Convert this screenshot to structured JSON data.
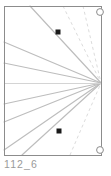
{
  "figure": {
    "caption": "112_6",
    "type": "perspective-line-diagram",
    "canvas": {
      "width": 111,
      "height": 176
    },
    "colors": {
      "frame": "#8c8c8c",
      "ray": "#bdbdbd",
      "ray_faint": "#d4d4d4",
      "dashed": "#dcdcdc",
      "point_marker": "#1a1a1a",
      "circle_marker": "#8c8c8c",
      "background": "#ffffff",
      "caption_text": "#9a9a9a"
    },
    "frame": {
      "x": 4,
      "y": 6,
      "width": 97,
      "height": 149
    },
    "vanishing_point": {
      "x": 101,
      "y": 83
    },
    "horizon_line": {
      "x1": 4,
      "y1": 83,
      "x2": 101,
      "y2": 83
    },
    "rays": [
      {
        "name": "ray-top-steep",
        "x1": 30,
        "y1": 6,
        "x2": 101,
        "y2": 83
      },
      {
        "name": "ray-upper-left-edge",
        "x1": 4,
        "y1": 42,
        "x2": 101,
        "y2": 83
      },
      {
        "name": "ray-upper-shallow",
        "x1": 4,
        "y1": 63,
        "x2": 101,
        "y2": 83
      },
      {
        "name": "ray-lower-shallow",
        "x1": 4,
        "y1": 104,
        "x2": 101,
        "y2": 83
      },
      {
        "name": "ray-lower-left-edge",
        "x1": 4,
        "y1": 122,
        "x2": 101,
        "y2": 83
      },
      {
        "name": "ray-bottom-steep",
        "x1": 22,
        "y1": 155,
        "x2": 101,
        "y2": 83
      },
      {
        "name": "ray-bottom-corner",
        "x1": 4,
        "y1": 150,
        "x2": 101,
        "y2": 83
      }
    ],
    "dashed_rays": [
      {
        "name": "dashed-ray-upper",
        "x1": 63,
        "y1": 6,
        "x2": 101,
        "y2": 83
      },
      {
        "name": "dashed-ray-upper-outer",
        "x1": 83,
        "y1": 6,
        "x2": 101,
        "y2": 83
      },
      {
        "name": "dashed-ray-lower",
        "x1": 70,
        "y1": 155,
        "x2": 101,
        "y2": 83
      }
    ],
    "point_markers": [
      {
        "name": "point-marker-upper",
        "x": 58,
        "y": 32,
        "size": 5
      },
      {
        "name": "point-marker-lower",
        "x": 59,
        "y": 131,
        "size": 5
      }
    ],
    "circle_markers": [
      {
        "name": "circle-marker-top-right",
        "cx": 100,
        "cy": 12,
        "r": 3.4
      },
      {
        "name": "circle-marker-bottom-right",
        "cx": 100,
        "cy": 150,
        "r": 3.4
      }
    ]
  }
}
